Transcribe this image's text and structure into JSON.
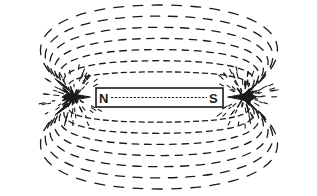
{
  "diagram": {
    "magnet": {
      "north_label": "N",
      "south_label": "S",
      "x": 96,
      "y": 88,
      "width": 127,
      "height": 19
    },
    "colors": {
      "ink": "#1a1a1a",
      "background": "#ffffff"
    },
    "field_lines": {
      "style": "dashed",
      "count_per_side": 7,
      "origin_left": [
        78,
        97
      ],
      "origin_right": [
        240,
        97
      ]
    }
  }
}
